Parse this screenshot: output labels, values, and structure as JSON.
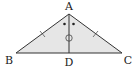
{
  "diagram": {
    "type": "geometry",
    "shape": "isosceles triangle",
    "fill_color": "#e6e6e6",
    "stroke_color": "#333333",
    "points": {
      "A": {
        "label": "A",
        "x": 69,
        "y": 14,
        "label_x": 69,
        "label_y": 10
      },
      "B": {
        "label": "B",
        "x": 16,
        "y": 53,
        "label_x": 9,
        "label_y": 64
      },
      "C": {
        "label": "C",
        "x": 122,
        "y": 53,
        "label_x": 128,
        "label_y": 64
      },
      "D": {
        "label": "D",
        "x": 69,
        "y": 53,
        "label_x": 69,
        "label_y": 66
      }
    },
    "segments": [
      "AB",
      "AC",
      "BC",
      "AD"
    ],
    "marks": {
      "equal_sides": [
        "AB",
        "AC"
      ],
      "equal_angles": [
        "BAD",
        "CAD"
      ],
      "circle_mark_on": "AD"
    }
  }
}
